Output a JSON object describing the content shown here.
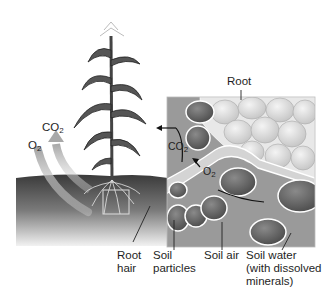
{
  "diagram": {
    "labels": {
      "root": "Root",
      "co2_air_main": "CO",
      "co2_air_sub": "2",
      "o2_air_main": "O",
      "o2_air_sub": "2",
      "co2_inset_main": "CO",
      "co2_inset_sub": "2",
      "o2_inset_main": "O",
      "o2_inset_sub": "2",
      "root_hair_line1": "Root",
      "root_hair_line2": "hair",
      "soil_particles_line1": "Soil",
      "soil_particles_line2": "particles",
      "soil_air": "Soil air",
      "soil_water_line1": "Soil water",
      "soil_water_line2": "(with dissolved",
      "soil_water_line3": "minerals)"
    },
    "colors": {
      "soil_dark": "#2e2e2e",
      "inset_bg": "#9a9a9a",
      "root_cells": "#d8d8d8",
      "particles": "#6a6a6a",
      "arrow_gray": "#b5b5b5",
      "text": "#1e1e1e"
    }
  }
}
